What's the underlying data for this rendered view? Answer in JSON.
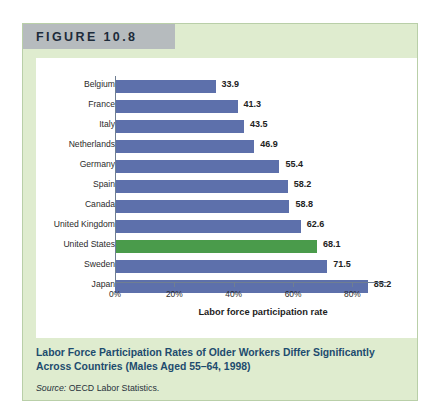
{
  "figure": {
    "banner_label": "FIGURE 10.8",
    "caption_title": "Labor Force Participation Rates of Older Workers Differ Significantly Across Countries (Males Aged 55–64, 1998)",
    "source_prefix": "Source:",
    "source_text": "OECD Labor Statistics.",
    "colors": {
      "panel_background": "#dfeccf",
      "banner_background": "#b6bbbe",
      "bar_default": "#5d70ab",
      "bar_highlight": "#4a9b4b",
      "caption_title_color": "#1d4b6e",
      "axis_color": "#6f7e92"
    }
  },
  "chart_data": {
    "type": "bar",
    "orientation": "horizontal",
    "title": "Labor Force Participation Rates of Older Workers Differ Significantly Across Countries (Males Aged 55–64, 1998)",
    "xlabel": "Labor force participation rate",
    "ylabel": "",
    "xlim": [
      0,
      92
    ],
    "xticks": [
      0,
      20,
      40,
      60,
      80
    ],
    "xtick_labels": [
      "0%",
      "20%",
      "40%",
      "60%",
      "80%"
    ],
    "grid": false,
    "legend": false,
    "value_format": "one-decimal",
    "categories": [
      "Belgium",
      "France",
      "Italy",
      "Netherlands",
      "Germany",
      "Spain",
      "Canada",
      "United Kingdom",
      "United States",
      "Sweden",
      "Japan"
    ],
    "values": [
      33.9,
      41.3,
      43.5,
      46.9,
      55.4,
      58.2,
      58.8,
      62.6,
      68.1,
      71.5,
      85.2
    ],
    "value_labels": [
      "33.9",
      "41.3",
      "43.5",
      "46.9",
      "55.4",
      "58.2",
      "58.8",
      "62.6",
      "68.1",
      "71.5",
      "85.2"
    ],
    "highlighted_category": "United States",
    "bars": [
      {
        "label": "Belgium",
        "value": 33.9,
        "value_label": "33.9",
        "highlight": false
      },
      {
        "label": "France",
        "value": 41.3,
        "value_label": "41.3",
        "highlight": false
      },
      {
        "label": "Italy",
        "value": 43.5,
        "value_label": "43.5",
        "highlight": false
      },
      {
        "label": "Netherlands",
        "value": 46.9,
        "value_label": "46.9",
        "highlight": false
      },
      {
        "label": "Germany",
        "value": 55.4,
        "value_label": "55.4",
        "highlight": false
      },
      {
        "label": "Spain",
        "value": 58.2,
        "value_label": "58.2",
        "highlight": false
      },
      {
        "label": "Canada",
        "value": 58.8,
        "value_label": "58.8",
        "highlight": false
      },
      {
        "label": "United Kingdom",
        "value": 62.6,
        "value_label": "62.6",
        "highlight": false
      },
      {
        "label": "United States",
        "value": 68.1,
        "value_label": "68.1",
        "highlight": true
      },
      {
        "label": "Sweden",
        "value": 71.5,
        "value_label": "71.5",
        "highlight": false
      },
      {
        "label": "Japan",
        "value": 85.2,
        "value_label": "85.2",
        "highlight": false
      }
    ]
  }
}
